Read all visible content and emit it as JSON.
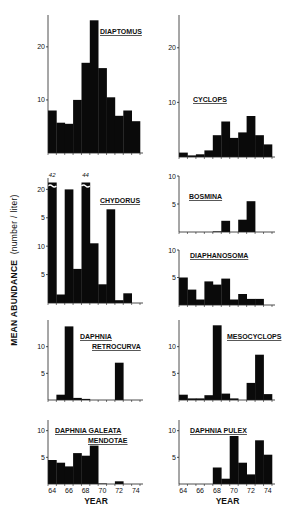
{
  "chart_data": [
    {
      "type": "bar",
      "title": "DIAPTOMUS",
      "panel": "row1-left",
      "categories": [
        "64",
        "65",
        "66",
        "67",
        "68",
        "69",
        "70",
        "71",
        "72",
        "73",
        "74"
      ],
      "values": [
        8,
        5.7,
        5.5,
        10,
        17,
        25,
        16,
        10.5,
        7,
        8,
        6
      ],
      "yticks": [
        10,
        20
      ],
      "ylim": [
        0,
        26
      ],
      "xlabel": "",
      "ylabel": ""
    },
    {
      "type": "bar",
      "title": "CYCLOPS",
      "panel": "row1-right",
      "categories": [
        "64",
        "65",
        "66",
        "67",
        "68",
        "69",
        "70",
        "71",
        "72",
        "73",
        "74"
      ],
      "values": [
        0.8,
        0.3,
        0.5,
        1.2,
        4,
        6.5,
        3.5,
        4.5,
        7.5,
        4,
        2.3
      ],
      "yticks": [
        10,
        20
      ],
      "ylim": [
        0,
        26
      ],
      "xlabel": "",
      "ylabel": ""
    },
    {
      "type": "bar",
      "title": "CHYDORUS",
      "panel": "row2-left",
      "categories": [
        "64",
        "65",
        "66",
        "67",
        "68",
        "69",
        "70",
        "71",
        "72",
        "73",
        "74"
      ],
      "values": [
        42,
        1.5,
        20,
        6,
        44,
        10.5,
        3.3,
        16.5,
        0.5,
        1.7,
        0
      ],
      "broken_bars": {
        "64": "42",
        "68": "44"
      },
      "yticks": [
        5,
        10,
        15,
        20
      ],
      "ytick_labels": [
        "5",
        "10",
        "5",
        "20"
      ],
      "ylim": [
        0,
        22
      ],
      "xlabel": "",
      "ylabel": ""
    },
    {
      "type": "bar",
      "title": "BOSMINA",
      "panel": "row2-right-top",
      "categories": [
        "64",
        "65",
        "66",
        "67",
        "68",
        "69",
        "70",
        "71",
        "72",
        "73",
        "74"
      ],
      "values": [
        0,
        0,
        0,
        0,
        0.1,
        2,
        0,
        2.2,
        5.5,
        0,
        0
      ],
      "yticks": [
        5,
        10
      ],
      "ylim": [
        0,
        10
      ],
      "xlabel": "",
      "ylabel": ""
    },
    {
      "type": "bar",
      "title": "DIAPHANOSOMA",
      "panel": "row2-right-bottom",
      "categories": [
        "64",
        "65",
        "66",
        "67",
        "68",
        "69",
        "70",
        "71",
        "72",
        "73",
        "74"
      ],
      "values": [
        5,
        2.8,
        1,
        4.3,
        3.7,
        4.8,
        1,
        2,
        1.1,
        1.1,
        0
      ],
      "yticks": [
        5,
        10
      ],
      "ylim": [
        0,
        10
      ],
      "xlabel": "",
      "ylabel": ""
    },
    {
      "type": "bar",
      "title": "DAPHNIA RETROCURVA",
      "panel": "row3-left",
      "categories": [
        "64",
        "65",
        "66",
        "67",
        "68",
        "69",
        "70",
        "71",
        "72",
        "73",
        "74"
      ],
      "values": [
        0,
        1,
        13.8,
        0.4,
        0.2,
        0,
        0,
        0,
        7,
        0,
        0
      ],
      "yticks": [
        5,
        10
      ],
      "ylim": [
        0,
        15
      ],
      "xlabel": "",
      "ylabel": ""
    },
    {
      "type": "bar",
      "title": "MESOCYCLOPS",
      "panel": "row3-right",
      "categories": [
        "64",
        "65",
        "66",
        "67",
        "68",
        "69",
        "70",
        "71",
        "72",
        "73",
        "74"
      ],
      "values": [
        1,
        0.3,
        0.3,
        0.9,
        14,
        1.2,
        0.3,
        0,
        3.2,
        8.5,
        1.1
      ],
      "yticks": [
        5,
        10
      ],
      "ylim": [
        0,
        15
      ],
      "xlabel": "",
      "ylabel": ""
    },
    {
      "type": "bar",
      "title": "DAPHNIA GALEATA MENDOTAE",
      "panel": "row4-left",
      "categories": [
        "64",
        "65",
        "66",
        "67",
        "68",
        "69",
        "70",
        "71",
        "72",
        "73",
        "74"
      ],
      "values": [
        4.5,
        4,
        3.3,
        5.8,
        5.3,
        7.2,
        0.1,
        0,
        0.5,
        0,
        0
      ],
      "yticks": [
        5,
        10
      ],
      "ylim": [
        0,
        12
      ],
      "xlabel": "YEAR",
      "ylabel": ""
    },
    {
      "type": "bar",
      "title": "DAPHNIA PULEX",
      "panel": "row4-right",
      "categories": [
        "64",
        "65",
        "66",
        "67",
        "68",
        "69",
        "70",
        "71",
        "72",
        "73",
        "74"
      ],
      "values": [
        0,
        0,
        0,
        0,
        3.1,
        1,
        9,
        4,
        1.8,
        8.2,
        5.5
      ],
      "yticks": [
        5,
        10
      ],
      "ylim": [
        0,
        12
      ],
      "xlabel": "YEAR",
      "ylabel": ""
    }
  ],
  "figure": {
    "ylabel_main": "MEAN ABUNDANCE",
    "ylabel_unit": "(number / liter)",
    "xlabel": "YEAR",
    "xtick_labels": [
      "64",
      "66",
      "68",
      "70",
      "72",
      "74"
    ],
    "bar_color": "#0a0a0a",
    "background": "#ffffff"
  }
}
